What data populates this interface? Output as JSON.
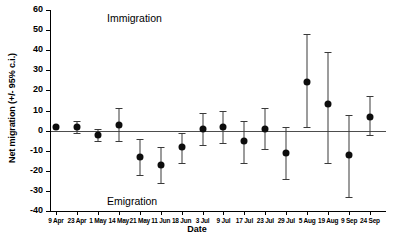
{
  "chart_data": {
    "type": "scatter",
    "title": "",
    "xlabel": "Date",
    "ylabel": "Net migration (+/- 95% c.i.)",
    "ylim": [
      -40,
      60
    ],
    "yticks": [
      60,
      50,
      40,
      30,
      20,
      10,
      0,
      -10,
      -20,
      -30,
      -40
    ],
    "grid": false,
    "legend": "none",
    "zero_reference_line": true,
    "annotations": [
      {
        "text": "Immigration",
        "x": "9 Apr",
        "y": 58,
        "note": "upper region label"
      },
      {
        "text": "Emigration",
        "x": "9 Apr",
        "y": -33,
        "note": "lower region label"
      }
    ],
    "categories": [
      "9 Apr",
      "23 Apr",
      "1 May",
      "14 May",
      "21 May",
      "11 Jun",
      "18 Jun",
      "3 Jul",
      "9 Jul",
      "17 Jul",
      "23 Jul",
      "29 Jul",
      "5 Aug",
      "19 Aug",
      "9 Sep",
      "24 Sep"
    ],
    "series": [
      {
        "name": "Net migration",
        "values": [
          2,
          2,
          -2,
          3,
          -13,
          -17,
          -8,
          1,
          2,
          -5,
          1,
          -11,
          24,
          13,
          -12,
          7
        ],
        "ci_lower": [
          2,
          -1,
          -5,
          -5,
          -22,
          -26,
          -16,
          -7,
          -6,
          -16,
          -9,
          -24,
          2,
          -16,
          -33,
          -2
        ],
        "ci_upper": [
          2,
          5,
          1,
          11,
          -4,
          -8,
          -1,
          9,
          10,
          5,
          11,
          2,
          48,
          39,
          8,
          17
        ]
      }
    ]
  }
}
